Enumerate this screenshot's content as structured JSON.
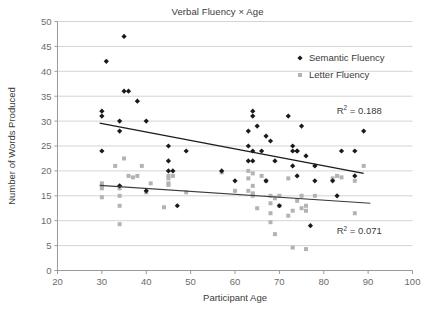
{
  "chart_data": {
    "type": "scatter",
    "title": "Verbal Fluency × Age",
    "xlabel": "Participant Age",
    "ylabel": "Number of Words Produced",
    "xlim": [
      20,
      100
    ],
    "ylim": [
      0,
      50
    ],
    "xticks": [
      20,
      30,
      40,
      50,
      60,
      70,
      80,
      90,
      100
    ],
    "yticks": [
      0,
      5,
      10,
      15,
      20,
      25,
      30,
      35,
      40,
      45,
      50
    ],
    "grid": "horizontal",
    "legend_position": "top-right",
    "annotations": [
      {
        "name": "r2-semantic",
        "text_base": "R",
        "text_sup": "2",
        "text_rest": " = 0.188",
        "x": 88.0,
        "y": 31.5
      },
      {
        "name": "r2-letter",
        "text_base": "R",
        "text_sup": "2",
        "text_rest": " = 0.071",
        "x": 88.0,
        "y": 7.3
      }
    ],
    "series": [
      {
        "name": "Semantic Fluency",
        "marker": "diamond",
        "color": "#1a1a1a",
        "points": [
          [
            30,
            32
          ],
          [
            30,
            31
          ],
          [
            30,
            24
          ],
          [
            31,
            42
          ],
          [
            34,
            30
          ],
          [
            34,
            28
          ],
          [
            34,
            17
          ],
          [
            35,
            36
          ],
          [
            35,
            47
          ],
          [
            36,
            36
          ],
          [
            38,
            34
          ],
          [
            40,
            30
          ],
          [
            40,
            16
          ],
          [
            45,
            25
          ],
          [
            45,
            22
          ],
          [
            45,
            20
          ],
          [
            46,
            20
          ],
          [
            47,
            13
          ],
          [
            49,
            24
          ],
          [
            57,
            20
          ],
          [
            60,
            18
          ],
          [
            63,
            28
          ],
          [
            63,
            22
          ],
          [
            63,
            25
          ],
          [
            64,
            31
          ],
          [
            64,
            22
          ],
          [
            64,
            24
          ],
          [
            64,
            32
          ],
          [
            65,
            29
          ],
          [
            66,
            24
          ],
          [
            67,
            27
          ],
          [
            67,
            18
          ],
          [
            68,
            26
          ],
          [
            69,
            22
          ],
          [
            70,
            13
          ],
          [
            72,
            31
          ],
          [
            73,
            25
          ],
          [
            73,
            24
          ],
          [
            73,
            21
          ],
          [
            74,
            19
          ],
          [
            74,
            24
          ],
          [
            74,
            24
          ],
          [
            75,
            29
          ],
          [
            76,
            23
          ],
          [
            77,
            9
          ],
          [
            78,
            21
          ],
          [
            78,
            18
          ],
          [
            82,
            18
          ],
          [
            83,
            15
          ],
          [
            84,
            24
          ],
          [
            87,
            24
          ],
          [
            87,
            19
          ],
          [
            89,
            28
          ]
        ]
      },
      {
        "name": "Letter Fluency",
        "marker": "square",
        "color": "#b3b3b3",
        "points": [
          [
            30,
            17
          ],
          [
            30,
            16.5
          ],
          [
            30,
            17.5
          ],
          [
            30,
            14.7
          ],
          [
            33,
            21
          ],
          [
            34,
            16.5
          ],
          [
            34,
            15
          ],
          [
            34,
            13
          ],
          [
            34,
            9.3
          ],
          [
            35,
            22.5
          ],
          [
            36,
            19
          ],
          [
            37,
            18.7
          ],
          [
            38,
            19
          ],
          [
            39,
            21
          ],
          [
            40,
            15.7
          ],
          [
            41,
            17.5
          ],
          [
            44,
            12.7
          ],
          [
            45,
            19
          ],
          [
            45,
            18.5
          ],
          [
            45,
            17.5
          ],
          [
            45,
            17.2
          ],
          [
            46,
            19
          ],
          [
            49,
            15.7
          ],
          [
            57,
            19.7
          ],
          [
            60,
            16
          ],
          [
            63,
            20
          ],
          [
            63,
            18.5
          ],
          [
            63,
            16
          ],
          [
            64,
            19.5
          ],
          [
            64,
            17
          ],
          [
            64,
            15.5
          ],
          [
            64,
            15
          ],
          [
            65,
            12.5
          ],
          [
            66,
            19
          ],
          [
            67,
            18
          ],
          [
            68,
            15
          ],
          [
            68,
            11.5
          ],
          [
            68,
            9.7
          ],
          [
            68,
            13.5
          ],
          [
            69,
            7.3
          ],
          [
            69,
            14.5
          ],
          [
            70,
            15
          ],
          [
            70,
            13
          ],
          [
            72,
            11
          ],
          [
            72,
            18.5
          ],
          [
            73,
            12
          ],
          [
            73,
            4.6
          ],
          [
            74,
            14
          ],
          [
            75,
            15
          ],
          [
            75,
            12.5
          ],
          [
            76,
            13
          ],
          [
            76,
            12
          ],
          [
            76,
            4.3
          ],
          [
            78,
            15
          ],
          [
            82,
            18.5
          ],
          [
            83,
            19
          ],
          [
            84,
            18.7
          ],
          [
            87,
            18
          ],
          [
            87,
            11.5
          ],
          [
            89,
            21
          ]
        ]
      }
    ],
    "trendlines": [
      {
        "name": "semantic-trendline",
        "series": "Semantic Fluency",
        "x1": 29.5,
        "y1": 29.6,
        "x2": 89.0,
        "y2": 19.5,
        "color": "#1a1a1a"
      },
      {
        "name": "letter-trendline",
        "series": "Letter Fluency",
        "x1": 29.5,
        "y1": 17.1,
        "x2": 90.5,
        "y2": 13.5,
        "color": "#3b3b3b"
      }
    ]
  },
  "legend": {
    "items": [
      {
        "label": "Semantic Fluency",
        "marker": "diamond",
        "color": "#1a1a1a"
      },
      {
        "label": "Letter Fluency",
        "marker": "square",
        "color": "#b3b3b3"
      }
    ]
  }
}
